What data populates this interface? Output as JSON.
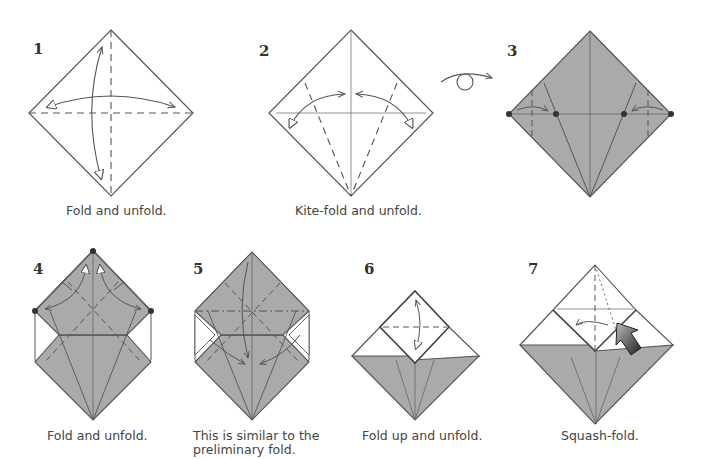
{
  "colors": {
    "paper_colored": "#aaaaaa",
    "paper_white": "#ffffff",
    "line": "#555555",
    "text": "#444444"
  },
  "steps": [
    {
      "number": "1",
      "caption": "Fold and unfold."
    },
    {
      "number": "2",
      "caption": "Kite-fold and unfold."
    },
    {
      "number": "3",
      "caption": ""
    },
    {
      "number": "4",
      "caption": "Fold and unfold."
    },
    {
      "number": "5",
      "caption_line1": "This is similar to the",
      "caption_line2": "preliminary fold."
    },
    {
      "number": "6",
      "caption": "Fold up and unfold."
    },
    {
      "number": "7",
      "caption": "Squash-fold."
    }
  ],
  "symbols": {
    "turn_over": "turn-over-icon",
    "push": "push-arrow-icon"
  }
}
